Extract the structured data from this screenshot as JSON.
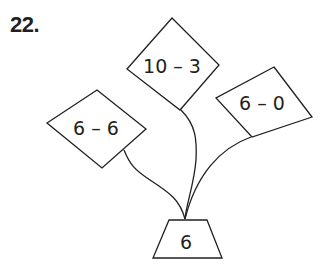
{
  "problem_number": "22.",
  "diagram": {
    "leaves": [
      {
        "expression": "10 – 3",
        "position": "top"
      },
      {
        "expression": "6 – 0",
        "position": "right"
      },
      {
        "expression": "6 – 6",
        "position": "left"
      }
    ],
    "pot": {
      "value": "6"
    }
  },
  "colors": {
    "stroke": "#231f20",
    "background": "#ffffff"
  }
}
